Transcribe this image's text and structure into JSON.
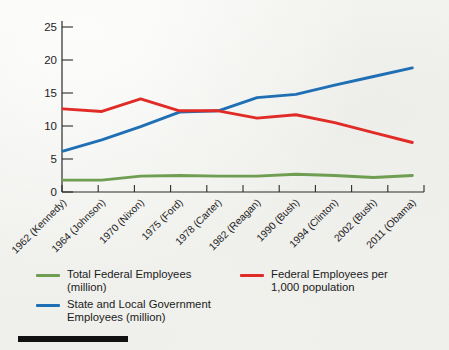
{
  "chart_data": {
    "type": "line",
    "title": "",
    "subtitle": "",
    "xlabel": "",
    "ylabel": "",
    "ylim": [
      0,
      25
    ],
    "yticks": [
      0,
      5,
      10,
      15,
      20,
      25
    ],
    "ytick_labels": [
      "0",
      "5",
      "10",
      "15",
      "20",
      "25"
    ],
    "grid": false,
    "legend_position": "bottom",
    "categories": [
      "1962 (Kennedy)",
      "1964 (Johnson)",
      "1970 (Nixon)",
      "1975 (Ford)",
      "1978 (Carter)",
      "1982 (Reagan)",
      "1990 (Bush)",
      "1994 (Clinton)",
      "2002 (Bush)",
      "2011 (Obama)"
    ],
    "series": [
      {
        "name": "Total Federal Employees (million)",
        "legend_label": "Total Federal Employees\n(million)",
        "color": "#6f9e52",
        "values": [
          1.8,
          1.8,
          2.4,
          2.5,
          2.4,
          2.4,
          2.7,
          2.5,
          2.2,
          2.5
        ]
      },
      {
        "name": "State and Local Government Employees (million)",
        "legend_label": "State and Local Government\nEmployees (million)",
        "color": "#1f6fb5",
        "values": [
          6.2,
          7.9,
          9.9,
          12.1,
          12.3,
          14.3,
          14.8,
          16.2,
          17.5,
          18.8
        ]
      },
      {
        "name": "Federal Employees per 1,000 population",
        "legend_label": "Federal Employees per\n1,000 population",
        "color": "#e02b26",
        "values": [
          12.6,
          12.2,
          14.1,
          12.3,
          12.3,
          11.2,
          11.7,
          10.5,
          9.0,
          7.5
        ]
      }
    ]
  },
  "colors": {
    "background": "#f3f3f0",
    "axis": "#2b2b2b",
    "text": "#1b1b1b",
    "green": "#6f9e52",
    "blue": "#1f6fb5",
    "red": "#e02b26",
    "rule": "#111111"
  }
}
